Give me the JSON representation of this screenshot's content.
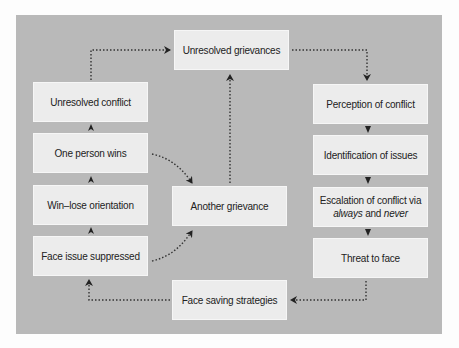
{
  "diagram": {
    "nodes": {
      "unresolved_grievances": "Unresolved grievances",
      "perception_of_conflict": "Perception of conflict",
      "identification_of_issues": "Identification of issues",
      "escalation_line1": "Escalation of conflict via",
      "escalation_always": "always",
      "escalation_and": " and ",
      "escalation_never": "never",
      "threat_to_face": "Threat to face",
      "face_saving_strategies": "Face saving strategies",
      "another_grievance": "Another grievance",
      "unresolved_conflict": "Unresolved conflict",
      "one_person_wins": "One person wins",
      "win_lose_orientation": "Win–lose orientation",
      "face_issue_suppressed": "Face issue suppressed"
    },
    "edges": [
      {
        "from": "Unresolved grievances",
        "to": "Perception of conflict",
        "style": "dotted"
      },
      {
        "from": "Perception of conflict",
        "to": "Identification of issues",
        "style": "arrowhead"
      },
      {
        "from": "Identification of issues",
        "to": "Escalation of conflict via always and never",
        "style": "arrowhead"
      },
      {
        "from": "Escalation of conflict via always and never",
        "to": "Threat to face",
        "style": "arrowhead"
      },
      {
        "from": "Threat to face",
        "to": "Face saving strategies",
        "style": "dotted"
      },
      {
        "from": "Face saving strategies",
        "to": "Face issue suppressed",
        "style": "dotted"
      },
      {
        "from": "Face issue suppressed",
        "to": "Win–lose orientation",
        "style": "arrowhead"
      },
      {
        "from": "Win–lose orientation",
        "to": "One person wins",
        "style": "arrowhead"
      },
      {
        "from": "One person wins",
        "to": "Unresolved conflict",
        "style": "arrowhead"
      },
      {
        "from": "Unresolved conflict",
        "to": "Unresolved grievances",
        "style": "dotted"
      },
      {
        "from": "One person wins",
        "to": "Another grievance",
        "style": "dotted-curve"
      },
      {
        "from": "Face issue suppressed",
        "to": "Another grievance",
        "style": "dotted-curve"
      },
      {
        "from": "Another grievance",
        "to": "Unresolved grievances",
        "style": "dotted"
      }
    ],
    "colors": {
      "panel": "#b9b9b9",
      "box": "#ececec",
      "arrow": "#222222",
      "background": "#fdfdfd"
    }
  }
}
